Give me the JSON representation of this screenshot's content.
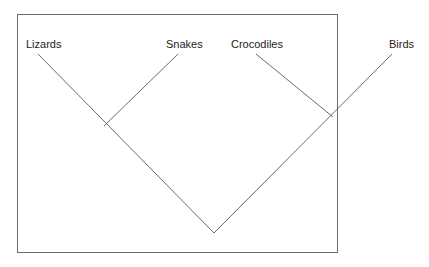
{
  "diagram": {
    "type": "cladogram",
    "taxa": [
      {
        "id": "lizards",
        "label": "Lizards"
      },
      {
        "id": "snakes",
        "label": "Snakes"
      },
      {
        "id": "crocodiles",
        "label": "Crocodiles"
      },
      {
        "id": "birds",
        "label": "Birds"
      }
    ],
    "clades": [
      {
        "members": [
          "lizards",
          "snakes"
        ]
      },
      {
        "members": [
          "crocodiles",
          "birds"
        ]
      },
      {
        "members": [
          "lizards",
          "snakes",
          "crocodiles",
          "birds"
        ]
      }
    ],
    "colors": {
      "line": "#6b6b6b",
      "text": "#222222",
      "background": "#ffffff"
    }
  }
}
